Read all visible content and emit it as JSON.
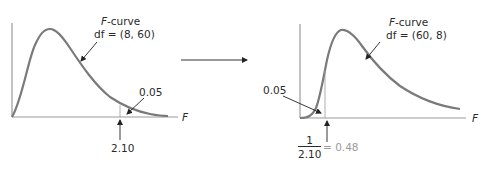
{
  "left_panel": {
    "curve_title_var": "F",
    "curve_title_rest": "-curve",
    "df_label": "df = (8, 60)",
    "tail_area": "0.05",
    "critical_value": "2.10",
    "axis_label": "F"
  },
  "right_panel": {
    "curve_title_var": "F",
    "curve_title_rest": "-curve",
    "df_label": "df = (60, 8)",
    "tail_area": "0.05",
    "fraction_numerator": "1",
    "fraction_denominator": "2.10",
    "result": "= 0.48",
    "axis_label": "F"
  },
  "colors": {
    "curve": "#7a7a7a",
    "axis": "#9a9a9a",
    "text": "#2a2a2a",
    "result_text": "#9a9a9a"
  }
}
